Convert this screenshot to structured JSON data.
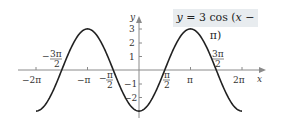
{
  "chart_data": {
    "type": "line",
    "title": "y = 3 cos (x − π)",
    "function": "3*cos(x - pi)",
    "xlabel": "x",
    "ylabel": "y",
    "xlim": [
      -6.283,
      6.283
    ],
    "ylim": [
      -3,
      3
    ],
    "grid": false,
    "x_ticks": [
      {
        "value": -6.2832,
        "label": "−2π"
      },
      {
        "value": -4.7124,
        "label": "−3π/2"
      },
      {
        "value": -3.1416,
        "label": "−π"
      },
      {
        "value": -1.5708,
        "label": "−π/2"
      },
      {
        "value": 1.5708,
        "label": "π/2"
      },
      {
        "value": 3.1416,
        "label": "π"
      },
      {
        "value": 4.7124,
        "label": "3π/2"
      },
      {
        "value": 6.2832,
        "label": "2π"
      }
    ],
    "y_ticks": [
      {
        "value": 3,
        "label": "3"
      },
      {
        "value": 2,
        "label": "2"
      },
      {
        "value": 1,
        "label": "1"
      },
      {
        "value": -1,
        "label": "−1"
      },
      {
        "value": -2,
        "label": "−2"
      }
    ],
    "series": [
      {
        "name": "y = 3 cos (x − π)",
        "x": [
          -6.2832,
          -4.7124,
          -3.1416,
          -1.5708,
          0,
          1.5708,
          3.1416,
          4.7124,
          6.2832
        ],
        "values": [
          -3,
          0,
          3,
          0,
          -3,
          0,
          3,
          0,
          -3
        ]
      }
    ],
    "annotation": {
      "text": "y = 3 cos (x − π)",
      "position": "top-right"
    }
  },
  "labels": {
    "x_axis": "x",
    "y_axis": "y",
    "neg_two_pi": "−2π",
    "neg_pi": "−π",
    "pi": "π",
    "two_pi": "2π",
    "y3": "3",
    "y2": "2",
    "y1": "1",
    "ym1": "−1",
    "ym2": "−2",
    "equation_prefix": "y",
    "equation_body": " = 3 cos (",
    "equation_var": "x",
    "equation_suffix": " − π)"
  },
  "colors": {
    "curve": "#222222",
    "axis": "#888888",
    "label_box": "#e8ecef"
  }
}
